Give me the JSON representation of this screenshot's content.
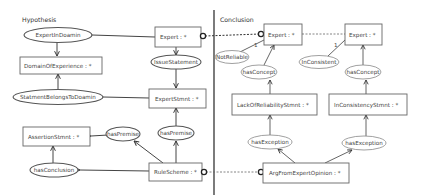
{
  "sections": {
    "hypothesis": "Hypothesis",
    "conclusion": "Conclusion"
  },
  "hypothesis": {
    "nodes": {
      "expert_in_domain": "ExpertInDoamin",
      "domain_of_experience": "DomainOfExperience : *",
      "statement_belongs_to_domain": "StatmentBelongsToDoamin",
      "assertion_stmnt": "AssertionStmnt : *",
      "has_premise_left": "hasPremise",
      "has_conclusion": "hasConclusion",
      "expert": "Expert : *",
      "issue_statement": "IssueStatement",
      "expert_stmnt": "ExpertStmnt : *",
      "has_premise_right": "hasPremise",
      "rule_scheme": "RuleScheme : *"
    }
  },
  "conclusion": {
    "nodes": {
      "expert_1": "Expert : *",
      "not_reliable": "NotReliable",
      "has_concept_1": "hasConcept",
      "lack_of_reliability_stmnt": "LackOfReliabilityStmnt : *",
      "has_exception_1": "hasException",
      "expert_2": "Expert : *",
      "in_consistent": "InConsistent",
      "has_concept_2": "hasConcept",
      "in_consistency_stmnt": "InConsistencyStmnt : *",
      "has_exception_2": "hasException",
      "arg_from_expert_opinion": "ArgFromExpertOpinion : *"
    },
    "multiplicity_1": "1",
    "multiplicity_2": "1"
  }
}
